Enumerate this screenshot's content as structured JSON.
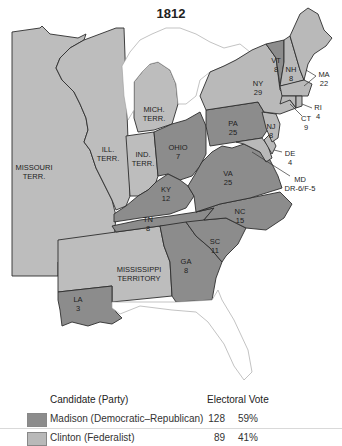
{
  "title": "1812",
  "map": {
    "fill_colors": {
      "democratic_republican": "#8c8c8c",
      "federalist": "#b9b9b9",
      "territory": "#bdbdbd",
      "water": "#ffffff"
    },
    "regions": [
      {
        "id": "missouri",
        "name": "MISSOURI",
        "name2": "TERR.",
        "type": "territory"
      },
      {
        "id": "illinois",
        "name": "ILL.",
        "name2": "TERR.",
        "type": "territory"
      },
      {
        "id": "indiana",
        "name": "IND.",
        "name2": "TERR.",
        "type": "territory"
      },
      {
        "id": "michigan",
        "name": "MICH.",
        "name2": "TERR.",
        "type": "territory"
      },
      {
        "id": "mississippi",
        "name": "MISSISSIPPI",
        "name2": "TERRITORY",
        "type": "territory"
      },
      {
        "id": "ohio",
        "name": "OHIO",
        "votes": "7",
        "party": "Democratic-Republican"
      },
      {
        "id": "kentucky",
        "name": "KY",
        "votes": "12",
        "party": "Democratic-Republican"
      },
      {
        "id": "tennessee",
        "name": "TN",
        "votes": "8",
        "party": "Democratic-Republican"
      },
      {
        "id": "louisiana",
        "name": "LA",
        "votes": "3",
        "party": "Democratic-Republican"
      },
      {
        "id": "georgia",
        "name": "GA",
        "votes": "8",
        "party": "Democratic-Republican"
      },
      {
        "id": "south_carolina",
        "name": "SC",
        "votes": "11",
        "party": "Democratic-Republican"
      },
      {
        "id": "north_carolina",
        "name": "NC",
        "votes": "15",
        "party": "Democratic-Republican"
      },
      {
        "id": "virginia",
        "name": "VA",
        "votes": "25",
        "party": "Democratic-Republican"
      },
      {
        "id": "pennsylvania",
        "name": "PA",
        "votes": "25",
        "party": "Democratic-Republican"
      },
      {
        "id": "maryland",
        "name": "MD",
        "votes": "DR-6/F-5",
        "party": "Split"
      },
      {
        "id": "delaware",
        "name": "DE",
        "votes": "4",
        "party": "Federalist"
      },
      {
        "id": "new_jersey",
        "name": "NJ",
        "votes": "8",
        "party": "Federalist"
      },
      {
        "id": "new_york",
        "name": "NY",
        "votes": "29",
        "party": "Federalist"
      },
      {
        "id": "vermont",
        "name": "VT",
        "votes": "8",
        "party": "Democratic-Republican"
      },
      {
        "id": "new_hampshire",
        "name": "NH",
        "votes": "8",
        "party": "Federalist"
      },
      {
        "id": "massachusetts",
        "name": "MA",
        "votes": "22",
        "party": "Federalist"
      },
      {
        "id": "rhode_island",
        "name": "RI",
        "votes": "4",
        "party": "Federalist"
      },
      {
        "id": "connecticut",
        "name": "CT",
        "votes": "9",
        "party": "Federalist"
      }
    ]
  },
  "legend": {
    "header_candidate": "Candidate (Party)",
    "header_votes": "Electoral Vote",
    "rows": [
      {
        "candidate": "Madison (Democratic–Republican)",
        "votes": "128",
        "percent": "59%",
        "color": "#8c8c8c"
      },
      {
        "candidate": "Clinton (Federalist)",
        "votes": "89",
        "percent": "41%",
        "color": "#b9b9b9"
      }
    ]
  }
}
